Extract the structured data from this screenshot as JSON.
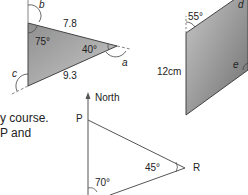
{
  "triangle1": {
    "side_top": "7.8",
    "side_bottom": "9.3",
    "angle_left": "75°",
    "angle_right": "40°",
    "exterior_labels": [
      "a",
      "b",
      "c"
    ]
  },
  "parallelogram": {
    "angle": "55°",
    "side": "12cm",
    "labels": [
      "d",
      "e"
    ]
  },
  "text_fragments": {
    "line1": "y course.",
    "line2": "P and"
  },
  "bearing_diagram": {
    "north_label": "North",
    "point_p": "P",
    "point_r": "R",
    "angle_r": "45°",
    "angle_q": "70°"
  },
  "colors": {
    "triangle_fill": "#a8a8a8",
    "parallelogram_fill": "#9a9a9a",
    "line": "#555555"
  }
}
